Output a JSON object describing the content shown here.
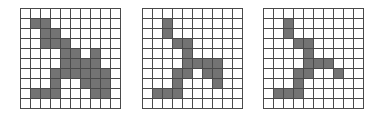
{
  "figure": {
    "rows": 10,
    "cols": 10,
    "fill_color": "#737373",
    "line_color": "#4a4a4a",
    "grids": [
      {
        "name": "grid-1",
        "left": 20,
        "filled": [
          [
            1,
            1
          ],
          [
            1,
            2
          ],
          [
            2,
            2
          ],
          [
            2,
            3
          ],
          [
            3,
            2
          ],
          [
            3,
            3
          ],
          [
            3,
            4
          ],
          [
            4,
            4
          ],
          [
            4,
            5
          ],
          [
            4,
            7
          ],
          [
            5,
            4
          ],
          [
            5,
            5
          ],
          [
            5,
            6
          ],
          [
            5,
            7
          ],
          [
            6,
            3
          ],
          [
            6,
            4
          ],
          [
            6,
            5
          ],
          [
            6,
            6
          ],
          [
            6,
            7
          ],
          [
            6,
            8
          ],
          [
            7,
            3
          ],
          [
            7,
            6
          ],
          [
            7,
            7
          ],
          [
            7,
            8
          ],
          [
            8,
            1
          ],
          [
            8,
            2
          ],
          [
            8,
            3
          ],
          [
            8,
            7
          ],
          [
            8,
            8
          ]
        ]
      },
      {
        "name": "grid-2",
        "left": 142,
        "filled": [
          [
            1,
            2
          ],
          [
            2,
            2
          ],
          [
            3,
            3
          ],
          [
            3,
            4
          ],
          [
            4,
            4
          ],
          [
            5,
            4
          ],
          [
            5,
            5
          ],
          [
            5,
            6
          ],
          [
            5,
            7
          ],
          [
            6,
            3
          ],
          [
            6,
            4
          ],
          [
            6,
            6
          ],
          [
            6,
            7
          ],
          [
            7,
            3
          ],
          [
            7,
            7
          ],
          [
            8,
            1
          ],
          [
            8,
            2
          ],
          [
            8,
            3
          ]
        ]
      },
      {
        "name": "grid-3",
        "left": 263,
        "filled": [
          [
            1,
            2
          ],
          [
            2,
            2
          ],
          [
            3,
            3
          ],
          [
            3,
            4
          ],
          [
            4,
            4
          ],
          [
            5,
            4
          ],
          [
            5,
            5
          ],
          [
            5,
            6
          ],
          [
            6,
            3
          ],
          [
            6,
            4
          ],
          [
            6,
            7
          ],
          [
            7,
            3
          ],
          [
            8,
            1
          ],
          [
            8,
            2
          ],
          [
            8,
            3
          ]
        ]
      }
    ]
  }
}
